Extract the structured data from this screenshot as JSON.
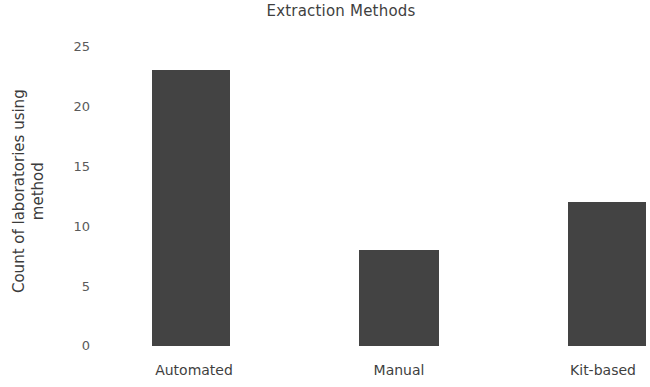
{
  "chart_data": {
    "type": "bar",
    "title": "Extraction Methods",
    "xlabel": "",
    "ylabel": "Count of laboratories using method",
    "ylabel_lines": [
      "Count of laboratories using",
      "method"
    ],
    "categories": [
      "Automated",
      "Manual",
      "Kit-based"
    ],
    "values": [
      23,
      8,
      12
    ],
    "series": [
      {
        "name": "Count of laboratories using method",
        "values": [
          23,
          8,
          12
        ]
      }
    ],
    "ylim": [
      0,
      25
    ],
    "yticks": [
      "25",
      "20",
      "15",
      "10",
      "5",
      "0"
    ],
    "ytick_values": [
      25,
      20,
      15,
      10,
      5,
      0
    ],
    "grid": false,
    "legend": "none",
    "bar_color": "#434343",
    "text_color": "#3f3f3f",
    "tick_color": "#5a5a5a",
    "background_color": "#ffffff"
  }
}
